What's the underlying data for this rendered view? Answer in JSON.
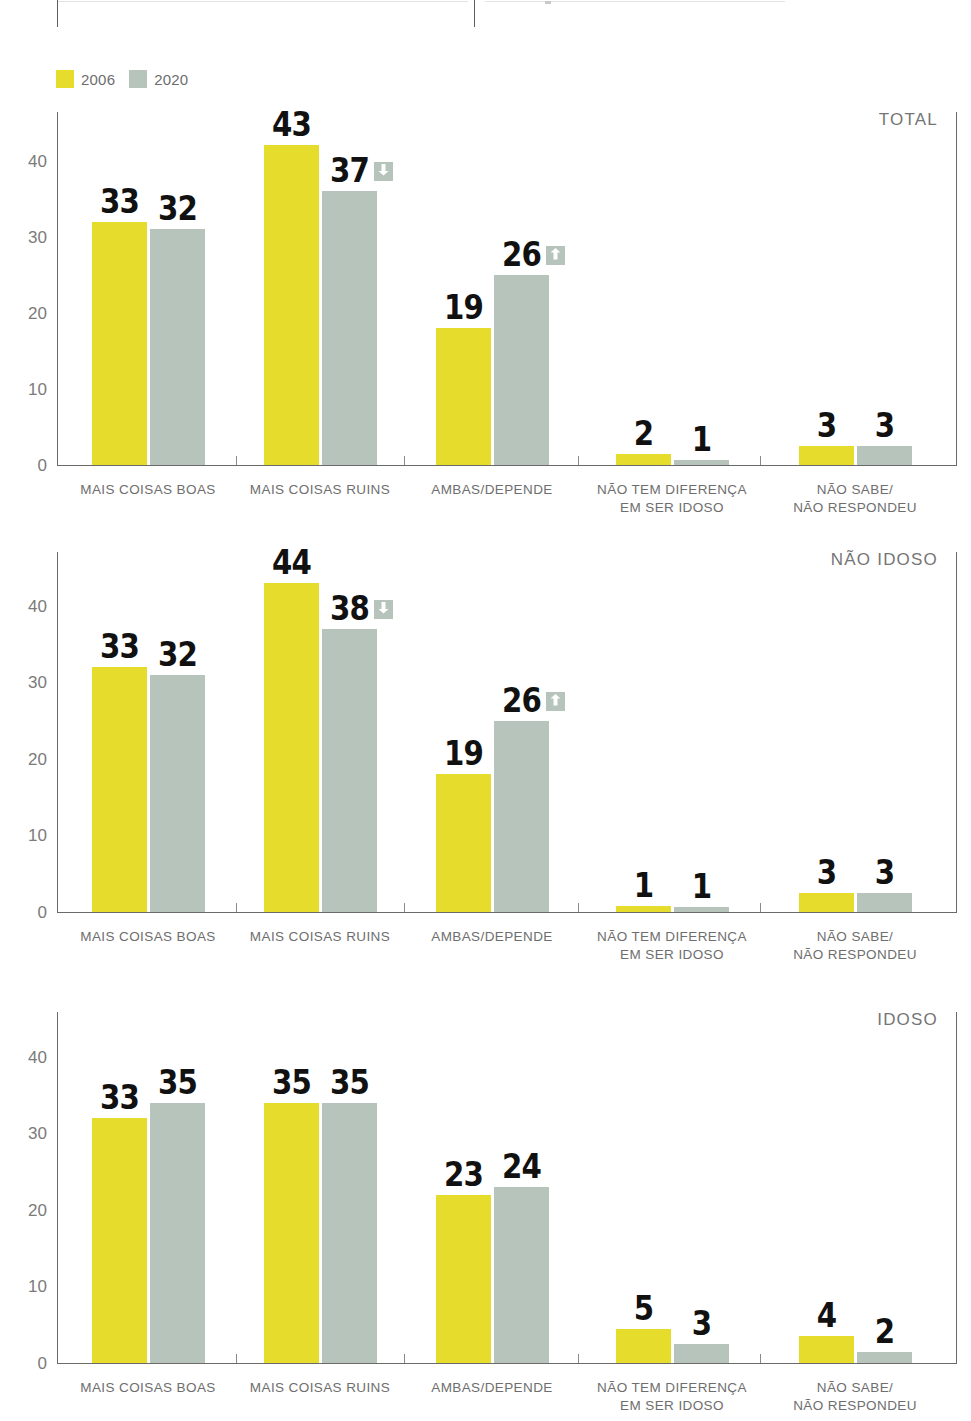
{
  "legend": {
    "items": [
      {
        "label": "2006",
        "color": "#E5DC2B",
        "icon": "swatch-icon"
      },
      {
        "label": "2020",
        "color": "#B6C4BC",
        "icon": "swatch-icon"
      }
    ]
  },
  "colors": {
    "series_2006": "#E5DC2B",
    "series_2020": "#B6C4BC",
    "value_label": "#111111",
    "axis": "#6a6a6a",
    "tick_text": "#7b7b7b",
    "category_text": "#6e6e6e",
    "panel_title": "#757575",
    "badge_bg": "#B6C4BC",
    "badge_arrow": "#ffffff"
  },
  "axis": {
    "y_ticks": [
      "0",
      "10",
      "20",
      "30",
      "40"
    ],
    "y_values": [
      0,
      10,
      20,
      30,
      40
    ],
    "y_max": 46
  },
  "categories": [
    "MAIS COISAS BOAS",
    "MAIS COISAS RUINS",
    "AMBAS/DEPENDE",
    "NÃO TEM DIFERENÇA\nEM SER IDOSO",
    "NÃO SABE/\nNÃO RESPONDEU"
  ],
  "panels": [
    {
      "title": "TOTAL",
      "values_2006": [
        33,
        43,
        19,
        2,
        3
      ],
      "values_2020": [
        32,
        37,
        26,
        1,
        3
      ],
      "bar_heights_2006": [
        32,
        42,
        18,
        1.5,
        2.5
      ],
      "bar_heights_2020": [
        31,
        36,
        25,
        0.7,
        2.5
      ],
      "trend_2020": [
        null,
        "down",
        "up",
        null,
        null
      ]
    },
    {
      "title": "NÃO IDOSO",
      "values_2006": [
        33,
        44,
        19,
        1,
        3
      ],
      "values_2020": [
        32,
        38,
        26,
        1,
        3
      ],
      "bar_heights_2006": [
        32,
        43,
        18,
        0.8,
        2.5
      ],
      "bar_heights_2020": [
        31,
        37,
        25,
        0.7,
        2.5
      ],
      "trend_2020": [
        null,
        "down",
        "up",
        null,
        null
      ]
    },
    {
      "title": "IDOSO",
      "values_2006": [
        33,
        35,
        23,
        5,
        4
      ],
      "values_2020": [
        35,
        35,
        24,
        3,
        2
      ],
      "bar_heights_2006": [
        32,
        34,
        22,
        4.5,
        3.5
      ],
      "bar_heights_2020": [
        34,
        34,
        23,
        2.5,
        1.5
      ],
      "trend_2020": [
        null,
        null,
        null,
        null,
        null
      ]
    }
  ],
  "chart_data": {
    "type": "bar",
    "title": "",
    "xlabel": "",
    "ylabel": "",
    "ylim": [
      0,
      46
    ],
    "grid": false,
    "legend_position": "top-left",
    "categories": [
      "MAIS COISAS BOAS",
      "MAIS COISAS RUINS",
      "AMBAS/DEPENDE",
      "NÃO TEM DIFERENÇA EM SER IDOSO",
      "NÃO SABE/NÃO RESPONDEU"
    ],
    "panels": [
      {
        "panel": "TOTAL",
        "series": [
          {
            "name": "2006",
            "values": [
              33,
              43,
              19,
              2,
              3
            ]
          },
          {
            "name": "2020",
            "values": [
              32,
              37,
              26,
              1,
              3
            ]
          }
        ],
        "annotations": [
          {
            "category": "MAIS COISAS RUINS",
            "series": "2020",
            "marker": "down-arrow"
          },
          {
            "category": "AMBAS/DEPENDE",
            "series": "2020",
            "marker": "up-arrow"
          }
        ]
      },
      {
        "panel": "NÃO IDOSO",
        "series": [
          {
            "name": "2006",
            "values": [
              33,
              44,
              19,
              1,
              3
            ]
          },
          {
            "name": "2020",
            "values": [
              32,
              38,
              26,
              1,
              3
            ]
          }
        ],
        "annotations": [
          {
            "category": "MAIS COISAS RUINS",
            "series": "2020",
            "marker": "down-arrow"
          },
          {
            "category": "AMBAS/DEPENDE",
            "series": "2020",
            "marker": "up-arrow"
          }
        ]
      },
      {
        "panel": "IDOSO",
        "series": [
          {
            "name": "2006",
            "values": [
              33,
              35,
              23,
              5,
              4
            ]
          },
          {
            "name": "2020",
            "values": [
              35,
              35,
              24,
              3,
              2
            ]
          }
        ],
        "annotations": []
      }
    ]
  }
}
